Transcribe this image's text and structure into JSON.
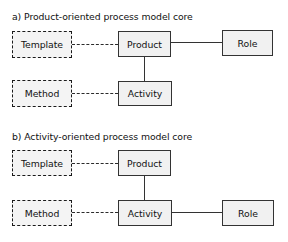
{
  "figure": {
    "background_color": "#ffffff",
    "node_fill_color": "#f1f1f1",
    "node_border_color": "#333333"
  },
  "sections": [
    {
      "id": "a",
      "title": "a) Product-oriented process model core",
      "nodes": [
        {
          "id": "template-a",
          "label": "Template",
          "style": "dashed"
        },
        {
          "id": "product-a",
          "label": "Product",
          "style": "solid"
        },
        {
          "id": "role-a",
          "label": "Role",
          "style": "solid"
        },
        {
          "id": "method-a",
          "label": "Method",
          "style": "dashed"
        },
        {
          "id": "activity-a",
          "label": "Activity",
          "style": "solid"
        }
      ],
      "connections": [
        {
          "from": "template-a",
          "to": "product-a",
          "style": "dashed"
        },
        {
          "from": "product-a",
          "to": "role-a",
          "style": "solid"
        },
        {
          "from": "product-a",
          "to": "activity-a",
          "style": "solid"
        },
        {
          "from": "method-a",
          "to": "activity-a",
          "style": "dashed"
        }
      ]
    },
    {
      "id": "b",
      "title": "b) Activity-oriented process model core",
      "nodes": [
        {
          "id": "template-b",
          "label": "Template",
          "style": "dashed"
        },
        {
          "id": "product-b",
          "label": "Product",
          "style": "solid"
        },
        {
          "id": "method-b",
          "label": "Method",
          "style": "dashed"
        },
        {
          "id": "activity-b",
          "label": "Activity",
          "style": "solid"
        },
        {
          "id": "role-b",
          "label": "Role",
          "style": "solid"
        }
      ],
      "connections": [
        {
          "from": "template-b",
          "to": "product-b",
          "style": "dashed"
        },
        {
          "from": "product-b",
          "to": "activity-b",
          "style": "solid"
        },
        {
          "from": "method-b",
          "to": "activity-b",
          "style": "dashed"
        },
        {
          "from": "activity-b",
          "to": "role-b",
          "style": "solid"
        }
      ]
    }
  ]
}
